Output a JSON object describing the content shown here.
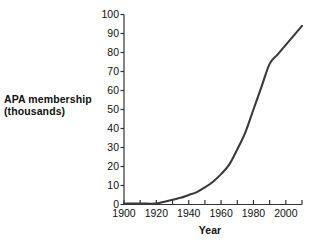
{
  "chart_data": {
    "type": "line",
    "title": "",
    "xlabel": "Year",
    "ylabel": "APA membership\n(thousands)",
    "ylabel_line1": "APA membership",
    "ylabel_line2": "(thousands)",
    "xlim": [
      1900,
      2010
    ],
    "ylim": [
      0,
      100
    ],
    "grid": false,
    "legend": null,
    "line_color": "#3a3a3a",
    "x_ticks_major": [
      1900,
      1920,
      1940,
      1960,
      1980,
      2000
    ],
    "x_tick_labels": [
      "1900",
      "1920",
      "1940",
      "1960",
      "1980",
      "2000"
    ],
    "x_ticks_minor": [
      1910,
      1930,
      1950,
      1970,
      1990,
      2010
    ],
    "y_ticks": [
      0,
      10,
      20,
      30,
      40,
      50,
      60,
      70,
      80,
      90,
      100
    ],
    "y_tick_labels": [
      "0",
      "10",
      "20",
      "30",
      "40",
      "50",
      "60",
      "70",
      "80",
      "90",
      "100"
    ],
    "series": [
      {
        "name": "APA membership",
        "x": [
          1900,
          1910,
          1920,
          1925,
          1930,
          1935,
          1940,
          1945,
          1950,
          1955,
          1960,
          1965,
          1970,
          1975,
          1980,
          1985,
          1990,
          1995,
          2000,
          2005,
          2010
        ],
        "values": [
          0.5,
          0.5,
          0.5,
          1.5,
          2.5,
          3.5,
          5,
          6.5,
          9,
          12,
          16,
          21,
          29,
          38,
          50,
          62,
          74,
          79,
          84,
          89,
          94
        ]
      }
    ]
  }
}
